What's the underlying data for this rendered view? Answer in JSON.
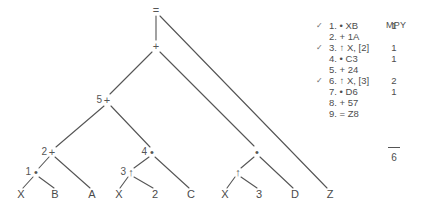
{
  "figure": {
    "type": "expression-tree-with-instruction-listing"
  },
  "tree": {
    "nodes": [
      {
        "id": "root",
        "num": "",
        "op": "=",
        "x": 156,
        "y": 10,
        "label": "="
      },
      {
        "id": "n_plus",
        "num": "",
        "op": "+",
        "x": 156,
        "y": 46,
        "label": "+"
      },
      {
        "id": "n5",
        "num": "5",
        "op": "+",
        "x": 107,
        "y": 100,
        "label": "+"
      },
      {
        "id": "n2",
        "num": "2",
        "op": "+",
        "x": 52,
        "y": 152,
        "label": "+"
      },
      {
        "id": "n1",
        "num": "1",
        "op": "*",
        "x": 36,
        "y": 172,
        "label": "•"
      },
      {
        "id": "n4",
        "num": "4",
        "op": "*",
        "x": 152,
        "y": 152,
        "label": "•"
      },
      {
        "id": "n3",
        "num": "3",
        "op": "↑",
        "x": 131,
        "y": 172,
        "label": "↑"
      },
      {
        "id": "nr",
        "num": "",
        "op": "*",
        "x": 257,
        "y": 152,
        "label": "•"
      },
      {
        "id": "nru",
        "num": "",
        "op": "↑",
        "x": 238,
        "y": 172,
        "label": "↑"
      }
    ],
    "leaves": [
      {
        "id": "l_X1",
        "label": "X",
        "x": 21,
        "y": 194
      },
      {
        "id": "l_B",
        "label": "B",
        "x": 55,
        "y": 194
      },
      {
        "id": "l_A",
        "label": "A",
        "x": 92,
        "y": 194
      },
      {
        "id": "l_X2",
        "label": "X",
        "x": 119,
        "y": 194
      },
      {
        "id": "l_2",
        "label": "2",
        "x": 155,
        "y": 194
      },
      {
        "id": "l_C",
        "label": "C",
        "x": 191,
        "y": 194
      },
      {
        "id": "l_X3",
        "label": "X",
        "x": 225,
        "y": 194
      },
      {
        "id": "l_3",
        "label": "3",
        "x": 259,
        "y": 194
      },
      {
        "id": "l_D",
        "label": "D",
        "x": 295,
        "y": 194
      },
      {
        "id": "l_Z",
        "label": "Z",
        "x": 330,
        "y": 194
      }
    ],
    "edges": [
      {
        "from": "root",
        "to": "n_plus",
        "x1": 156,
        "y1": 16,
        "x2": 156,
        "y2": 40
      },
      {
        "from": "root",
        "to": "l_Z",
        "x1": 160,
        "y1": 16,
        "x2": 327,
        "y2": 188
      },
      {
        "from": "n_plus",
        "to": "n5",
        "x1": 152,
        "y1": 52,
        "x2": 110,
        "y2": 94
      },
      {
        "from": "n_plus",
        "to": "nr",
        "x1": 160,
        "y1": 52,
        "x2": 254,
        "y2": 146
      },
      {
        "from": "n5",
        "to": "n2",
        "x1": 104,
        "y1": 106,
        "x2": 56,
        "y2": 147
      },
      {
        "from": "n5",
        "to": "n4",
        "x1": 111,
        "y1": 106,
        "x2": 150,
        "y2": 147
      },
      {
        "from": "n2",
        "to": "n1",
        "x1": 49,
        "y1": 157,
        "x2": 39,
        "y2": 168
      },
      {
        "from": "n2",
        "to": "l_A",
        "x1": 55,
        "y1": 157,
        "x2": 90,
        "y2": 188
      },
      {
        "from": "n1",
        "to": "l_X1",
        "x1": 33,
        "y1": 177,
        "x2": 23,
        "y2": 188
      },
      {
        "from": "n1",
        "to": "l_B",
        "x1": 39,
        "y1": 177,
        "x2": 54,
        "y2": 188
      },
      {
        "from": "n4",
        "to": "n3",
        "x1": 149,
        "y1": 157,
        "x2": 134,
        "y2": 168
      },
      {
        "from": "n4",
        "to": "l_C",
        "x1": 155,
        "y1": 157,
        "x2": 189,
        "y2": 188
      },
      {
        "from": "n3",
        "to": "l_X2",
        "x1": 128,
        "y1": 177,
        "x2": 120,
        "y2": 188
      },
      {
        "from": "n3",
        "to": "l_2",
        "x1": 134,
        "y1": 177,
        "x2": 153,
        "y2": 188
      },
      {
        "from": "nr",
        "to": "nru",
        "x1": 254,
        "y1": 157,
        "x2": 241,
        "y2": 168
      },
      {
        "from": "nr",
        "to": "l_D",
        "x1": 260,
        "y1": 157,
        "x2": 293,
        "y2": 188
      },
      {
        "from": "nru",
        "to": "l_X3",
        "x1": 235,
        "y1": 177,
        "x2": 227,
        "y2": 188
      },
      {
        "from": "nru",
        "to": "l_3",
        "x1": 241,
        "y1": 177,
        "x2": 257,
        "y2": 188
      }
    ]
  },
  "listing": {
    "mpy_header": "MPY",
    "rows": [
      {
        "check": "✓",
        "label": "1. • XB",
        "mpy": "1"
      },
      {
        "check": "",
        "label": "2. + 1A",
        "mpy": ""
      },
      {
        "check": "✓",
        "label": "3. ↑ X, [2]",
        "mpy": "1"
      },
      {
        "check": "",
        "label": "4. • C3",
        "mpy": "1"
      },
      {
        "check": "",
        "label": "5. + 24",
        "mpy": ""
      },
      {
        "check": "✓",
        "label": "6. ↑ X, [3]",
        "mpy": "2"
      },
      {
        "check": "",
        "label": "7. • D6",
        "mpy": "1"
      },
      {
        "check": "",
        "label": "8. + 57",
        "mpy": ""
      },
      {
        "check": "",
        "label": "9. = Z8",
        "mpy": ""
      }
    ],
    "total": "6"
  },
  "colors": {
    "background": "#ffffff",
    "ink": "#4a4a4a",
    "line": "#555555"
  }
}
